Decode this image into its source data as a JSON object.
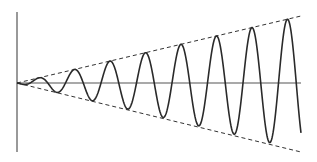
{
  "figure": {
    "colors": {
      "background": "#ffffff",
      "curve": "#2a2a2a",
      "axis": "#555555",
      "envelope": "#333333"
    },
    "axes": {
      "origin": [
        17,
        83
      ],
      "x_axis_end": [
        301,
        83
      ],
      "y_axis_top": [
        17,
        12
      ],
      "y_axis_bottom": [
        17,
        152
      ]
    },
    "envelope": {
      "upper_end": [
        301,
        16
      ],
      "lower_end": [
        301,
        152
      ],
      "style": "dashed"
    },
    "wave": {
      "x_start": 17,
      "x_end": 301,
      "period_px": 35.5,
      "phase_px": 13,
      "amplitude_growth": "linear",
      "end_point": [
        301,
        103
      ]
    }
  },
  "chart_data": {
    "type": "line",
    "title": "",
    "xlabel": "",
    "ylabel": "",
    "series": [
      {
        "name": "growing oscillation",
        "shape": "A(t)·sin(ωt), A(t) ∝ t"
      },
      {
        "name": "upper envelope",
        "shape": "+k·t (dashed)"
      },
      {
        "name": "lower envelope",
        "shape": "−k·t (dashed)"
      }
    ],
    "approx_cycles": 8.5,
    "grid": false,
    "legend": false
  }
}
